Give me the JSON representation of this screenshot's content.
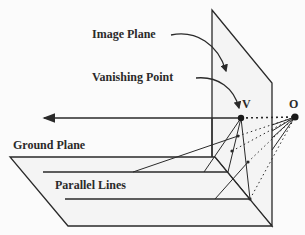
{
  "diagram": {
    "labels": {
      "image_plane": "Image Plane",
      "vanishing_point": "Vanishing Point",
      "v": "V",
      "o": "O",
      "ground_plane": "Ground Plane",
      "parallel_lines": "Parallel Lines"
    },
    "colors": {
      "stroke": "#2a2a2a",
      "plane_fill": "#f4f4f4",
      "background": "#fbfbfb"
    }
  }
}
